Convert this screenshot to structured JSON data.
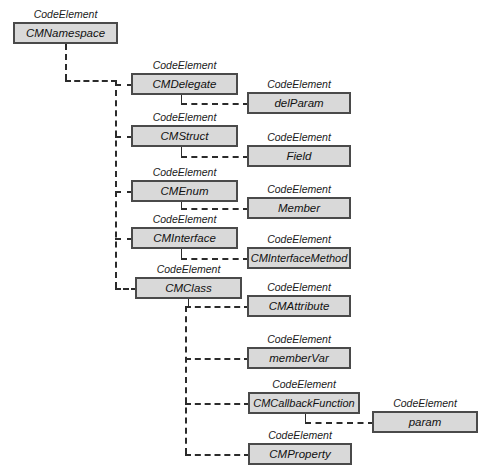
{
  "diagram": {
    "stereotype_label": "CodeElement",
    "colors": {
      "box_fill": "#d9d9d9",
      "box_border": "#4a4a4a",
      "connector": "#2b2b2b",
      "background": "#ffffff",
      "text": "#111111"
    },
    "nodes": [
      {
        "id": "cmnamespace",
        "label": "CMNamespace",
        "stereotype": "CodeElement",
        "x": 13,
        "y": 22,
        "w": 105,
        "h": 22
      },
      {
        "id": "cmdelegate",
        "label": "CMDelegate",
        "stereotype": "CodeElement",
        "x": 131,
        "y": 73,
        "w": 107,
        "h": 22
      },
      {
        "id": "delparam",
        "label": "delParam",
        "stereotype": "CodeElement",
        "x": 247,
        "y": 92,
        "w": 104,
        "h": 22
      },
      {
        "id": "cmstruct",
        "label": "CMStruct",
        "stereotype": "CodeElement",
        "x": 131,
        "y": 125,
        "w": 107,
        "h": 22
      },
      {
        "id": "field",
        "label": "Field",
        "stereotype": "CodeElement",
        "x": 247,
        "y": 145,
        "w": 104,
        "h": 22
      },
      {
        "id": "cmenum",
        "label": "CMEnum",
        "stereotype": "CodeElement",
        "x": 131,
        "y": 180,
        "w": 107,
        "h": 22
      },
      {
        "id": "member",
        "label": "Member",
        "stereotype": "CodeElement",
        "x": 247,
        "y": 197,
        "w": 104,
        "h": 22
      },
      {
        "id": "cminterface",
        "label": "CMInterface",
        "stereotype": "CodeElement",
        "x": 131,
        "y": 227,
        "w": 107,
        "h": 22
      },
      {
        "id": "cminterfacemethod",
        "label": "CMInterfaceMethod",
        "stereotype": "CodeElement",
        "x": 247,
        "y": 247,
        "w": 104,
        "h": 22
      },
      {
        "id": "cmclass",
        "label": "CMClass",
        "stereotype": "CodeElement",
        "x": 135,
        "y": 277,
        "w": 107,
        "h": 22
      },
      {
        "id": "cmattribute",
        "label": "CMAttribute",
        "stereotype": "CodeElement",
        "x": 247,
        "y": 295,
        "w": 104,
        "h": 22
      },
      {
        "id": "membervar",
        "label": "memberVar",
        "stereotype": "CodeElement",
        "x": 247,
        "y": 347,
        "w": 104,
        "h": 22
      },
      {
        "id": "cmcallbackfunction",
        "label": "CMCallbackFunction",
        "stereotype": "CodeElement",
        "x": 248,
        "y": 392,
        "w": 112,
        "h": 22
      },
      {
        "id": "param",
        "label": "param",
        "stereotype": "CodeElement",
        "x": 372,
        "y": 411,
        "w": 106,
        "h": 22
      },
      {
        "id": "cmproperty",
        "label": "CMProperty",
        "stereotype": "CodeElement",
        "x": 248,
        "y": 443,
        "w": 104,
        "h": 22
      }
    ],
    "edges": [
      {
        "id": "edge-cmnamespace-trunk",
        "from": "cmnamespace",
        "to": "trunk"
      },
      {
        "id": "edge-trunk-cmdelegate",
        "from": "trunk",
        "to": "cmdelegate"
      },
      {
        "id": "edge-trunk-cmstruct",
        "from": "trunk",
        "to": "cmstruct"
      },
      {
        "id": "edge-trunk-cmenum",
        "from": "trunk",
        "to": "cmenum"
      },
      {
        "id": "edge-trunk-cminterface",
        "from": "trunk",
        "to": "cminterface"
      },
      {
        "id": "edge-trunk-cmclass",
        "from": "trunk",
        "to": "cmclass"
      },
      {
        "id": "edge-cmdelegate-delparam",
        "from": "cmdelegate",
        "to": "delparam"
      },
      {
        "id": "edge-cmstruct-field",
        "from": "cmstruct",
        "to": "field"
      },
      {
        "id": "edge-cmenum-member",
        "from": "cmenum",
        "to": "member"
      },
      {
        "id": "edge-cminterface-cminterfacemethod",
        "from": "cminterface",
        "to": "cminterfacemethod"
      },
      {
        "id": "edge-cmclass-cmattribute",
        "from": "cmclass",
        "to": "cmattribute"
      },
      {
        "id": "edge-cmclass-membervar",
        "from": "cmclass",
        "to": "membervar"
      },
      {
        "id": "edge-cmclass-cmcallbackfunction",
        "from": "cmclass",
        "to": "cmcallbackfunction"
      },
      {
        "id": "edge-cmclass-cmproperty",
        "from": "cmclass",
        "to": "cmproperty"
      },
      {
        "id": "edge-cmcallbackfunction-param",
        "from": "cmcallbackfunction",
        "to": "param"
      }
    ]
  }
}
